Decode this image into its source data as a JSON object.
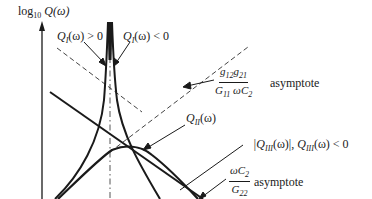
{
  "diagram": {
    "type": "log-frequency response sketch",
    "y_axis_label": {
      "prefix": "log",
      "subscript": "10",
      "func": "Q(ω)"
    },
    "labels": {
      "qi_pos": {
        "text": "Q",
        "sub": "I",
        "rest": "(ω) > 0"
      },
      "qi_neg": {
        "text": "Q",
        "sub": "I",
        "rest": "(ω) < 0"
      },
      "qii": {
        "text": "Q",
        "sub": "II",
        "rest": "(ω)"
      },
      "qiii": {
        "text_abs": "|Q",
        "sub": "III",
        "rest_abs": "(ω)|, ",
        "text2": "Q",
        "sub2": "III",
        "rest2": "(ω) < 0"
      },
      "asym_high": {
        "num": "g12g21",
        "num_parts": [
          "g",
          "12",
          "g",
          "21"
        ],
        "den_parts": [
          "G",
          "11",
          " ωC",
          "2"
        ],
        "suffix": "asymptote"
      },
      "asym_low": {
        "num_parts": [
          "ωC",
          "2"
        ],
        "den_parts": [
          "G",
          "22"
        ],
        "suffix": "asymptote"
      }
    },
    "curves": [
      "Q_I(ω) positive branch (rises to resonance spike)",
      "Q_I(ω) negative branch (falls from resonance spike)",
      "Q_II(ω) (hump near resonance, follows dashed asymptote)",
      "|Q_III(ω)| (straight descending line)",
      "g12g21/(G11 ωC2) asymptote (dashed descending)",
      "ωC2/G22 asymptote (dashed rising)",
      "resonance frequency marker (dash-dot vertical)"
    ],
    "stroke_color": "#1a1a1a"
  }
}
